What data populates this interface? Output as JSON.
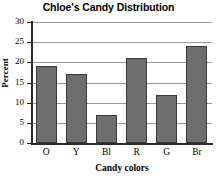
{
  "chart_data": {
    "type": "bar",
    "title": "Chloe's Candy Distribution",
    "xlabel": "Candy colors",
    "ylabel": "Percent",
    "categories": [
      "O",
      "Y",
      "Bl",
      "R",
      "G",
      "Br"
    ],
    "values": [
      19,
      17,
      7,
      21,
      12,
      24
    ],
    "ylim": [
      0,
      30
    ],
    "yticks": [
      0,
      5,
      10,
      15,
      20,
      25,
      30
    ],
    "ytick_labels": [
      "0",
      "5",
      "10",
      "15",
      "20",
      "25",
      "30"
    ],
    "grid": true,
    "grid_axis": "y",
    "legend": false,
    "legend_position": "none",
    "bar_color": "#6e6e6e",
    "bar_edge_color": "#3a3a3a",
    "gridline_color": "#9a9a9a",
    "axis_color": "#2b2b2b",
    "background_color": "#ffffff"
  }
}
